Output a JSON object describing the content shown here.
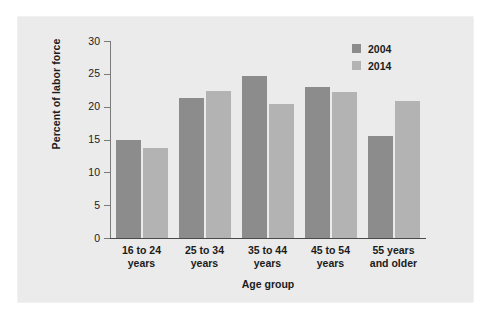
{
  "chart_data": {
    "type": "bar",
    "title": "",
    "xlabel": "Age group",
    "ylabel": "Percent of labor force",
    "categories": [
      "16 to 24 years",
      "25 to 34 years",
      "35 to 44 years",
      "45 to 54 years",
      "55 years and older"
    ],
    "category_lines": [
      [
        "16 to 24",
        "years"
      ],
      [
        "25 to 34",
        "years"
      ],
      [
        "35 to 44",
        "years"
      ],
      [
        "45 to 54",
        "years"
      ],
      [
        "55  years",
        "and older"
      ]
    ],
    "series": [
      {
        "name": "2004",
        "color": "#8c8c8c",
        "values": [
          15.0,
          21.3,
          24.7,
          23.0,
          15.5
        ]
      },
      {
        "name": "2014",
        "color": "#b3b3b3",
        "values": [
          13.7,
          22.4,
          20.4,
          22.2,
          20.9
        ]
      }
    ],
    "ylim": [
      0,
      30
    ],
    "yticks": [
      0,
      5,
      10,
      15,
      20,
      25,
      30
    ],
    "ytick_labels": [
      "0",
      "5",
      "10",
      "15",
      "20",
      "25",
      "30"
    ],
    "grid": false,
    "legend_position": "top-right",
    "legend_entries": [
      "2004",
      "2014"
    ]
  },
  "colors": {
    "page_background": "#ffffff",
    "panel_background": "#ebebeb",
    "series_2004": "#8c8c8c",
    "series_2014": "#b3b3b3",
    "axis": "#4a4a4a",
    "text": "#1b1b1b"
  }
}
